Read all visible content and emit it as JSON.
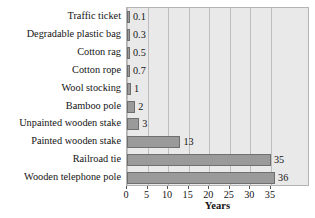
{
  "chart_data": {
    "type": "bar",
    "orientation": "horizontal",
    "title": "",
    "xlabel": "Years",
    "ylabel": "",
    "categories": [
      "Traffic ticket",
      "Degradable plastic bag",
      "Cotton rag",
      "Cotton rope",
      "Wool stocking",
      "Bamboo pole",
      "Unpainted wooden stake",
      "Painted wooden stake",
      "Railroad tie",
      "Wooden telephone pole"
    ],
    "values": [
      0.1,
      0.3,
      0.5,
      0.7,
      1,
      2,
      3,
      13,
      35,
      36
    ],
    "value_labels": [
      "0.1",
      "0.3",
      "0.5",
      "0.7",
      "1",
      "2",
      "3",
      "13",
      "35",
      "36"
    ],
    "xlim": [
      0,
      44.5
    ],
    "xticks": [
      0,
      5,
      10,
      15,
      20,
      25,
      30,
      35
    ],
    "xtick_labels": [
      "0",
      "5",
      "10",
      "15",
      "20",
      "25",
      "30",
      "35"
    ],
    "grid": "vertical",
    "legend": "none",
    "colors": {
      "bar_fill": "#9a9a9a",
      "bar_edge": "#6f6f6f",
      "plot_background": "#e9e9e9",
      "gridline": "#bdbdbd",
      "text": "#141414",
      "page_background": "#ffffff"
    }
  }
}
